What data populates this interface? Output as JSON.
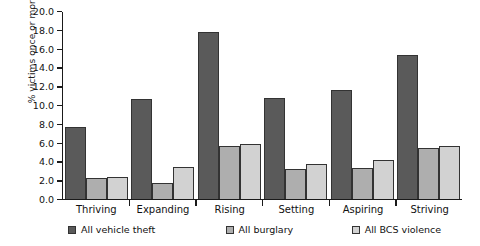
{
  "chart_data": {
    "type": "bar",
    "title": "",
    "xlabel": "",
    "ylabel": "% victims once or more",
    "ylim": [
      0,
      20
    ],
    "ytick_step": 2,
    "grid": false,
    "legend_position": "bottom",
    "categories": [
      "Thriving",
      "Expanding",
      "Rising",
      "Setting",
      "Aspiring",
      "Striving"
    ],
    "ytick_labels": [
      "0.0",
      "2.0",
      "4.0",
      "6.0",
      "8.0",
      "10.0",
      "12.0",
      "14.0",
      "16.0",
      "18.0",
      "20.0"
    ],
    "series": [
      {
        "name": "All vehicle theft",
        "color": "#5a5a5a",
        "values": [
          7.6,
          10.6,
          17.7,
          10.7,
          11.6,
          15.3
        ]
      },
      {
        "name": "All burglary",
        "color": "#aeaeae",
        "values": [
          2.2,
          1.7,
          5.6,
          3.1,
          3.3,
          5.4
        ]
      },
      {
        "name": "All BCS violence",
        "color": "#d2d2d2",
        "values": [
          2.3,
          3.35,
          5.8,
          3.7,
          4.1,
          5.65
        ]
      }
    ]
  }
}
